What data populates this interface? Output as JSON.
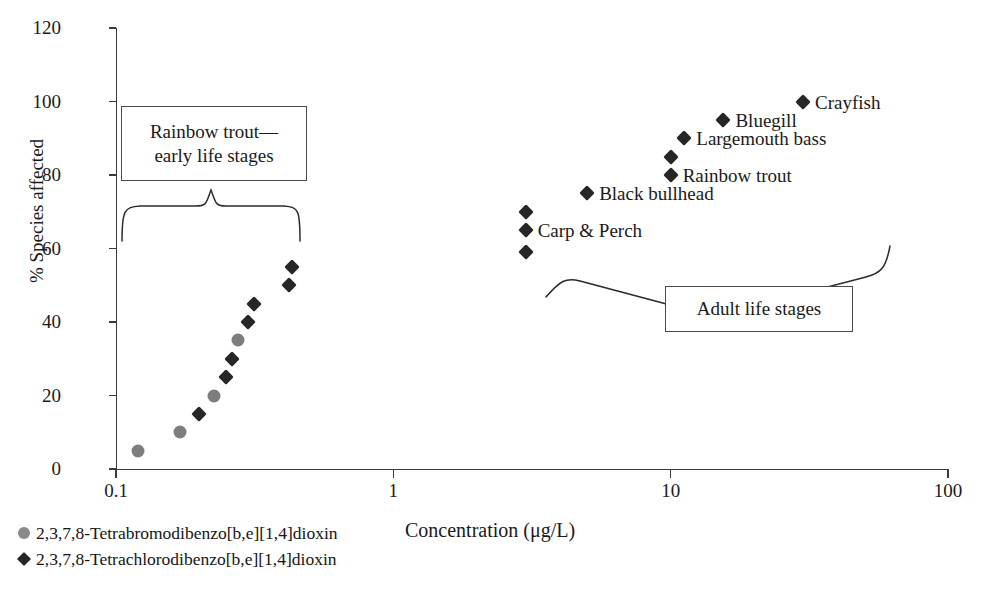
{
  "chart_data": {
    "type": "scatter",
    "title": "",
    "xlabel": "Concentration (μg/L)",
    "ylabel": "% Species affected",
    "xscale": "log",
    "xlim": [
      0.1,
      100
    ],
    "ylim": [
      0,
      120
    ],
    "xticks": [
      "0.1",
      "1",
      "10",
      "100"
    ],
    "xtick_values": [
      0.1,
      1,
      10,
      100
    ],
    "yticks": [
      "0",
      "20",
      "40",
      "60",
      "80",
      "100",
      "120"
    ],
    "ytick_values": [
      0,
      20,
      40,
      60,
      80,
      100,
      120
    ],
    "grid": false,
    "legend_position": "below-left",
    "series": [
      {
        "name": "2,3,7,8-Tetrabromodibenzo[b,e][1,4]dioxin",
        "marker": "circle",
        "color": "#7e7e7e",
        "points": [
          {
            "x": 0.12,
            "y": 5
          },
          {
            "x": 0.17,
            "y": 10
          },
          {
            "x": 0.225,
            "y": 20
          },
          {
            "x": 0.275,
            "y": 35
          }
        ]
      },
      {
        "name": "2,3,7,8-Tetrachlorodibenzo[b,e][1,4]dioxin",
        "marker": "diamond",
        "color": "#262626",
        "points": [
          {
            "x": 0.2,
            "y": 15
          },
          {
            "x": 0.25,
            "y": 25
          },
          {
            "x": 0.262,
            "y": 30
          },
          {
            "x": 0.3,
            "y": 40
          },
          {
            "x": 0.315,
            "y": 45
          },
          {
            "x": 0.42,
            "y": 50
          },
          {
            "x": 0.43,
            "y": 55
          },
          {
            "x": 3.0,
            "y": 59,
            "label": ""
          },
          {
            "x": 3.0,
            "y": 65,
            "label": "Carp & Perch"
          },
          {
            "x": 3.0,
            "y": 70,
            "label": ""
          },
          {
            "x": 5.0,
            "y": 75,
            "label": "Black bullhead"
          },
          {
            "x": 10.0,
            "y": 80,
            "label": "Rainbow trout"
          },
          {
            "x": 10.0,
            "y": 85,
            "label": ""
          },
          {
            "x": 11.2,
            "y": 90,
            "label": "Largemouth bass"
          },
          {
            "x": 15.5,
            "y": 95,
            "label": "Bluegill"
          },
          {
            "x": 30.0,
            "y": 100,
            "label": "Crayfish"
          }
        ]
      }
    ],
    "annotations": [
      {
        "name": "early-life-stages",
        "text_line1": "Rainbow trout—",
        "text_line2": "early life stages",
        "brace": "vertical-down",
        "group_x_range": [
          0.1,
          0.55
        ]
      },
      {
        "name": "adult-life-stages",
        "text_line1": "Adult life stages",
        "brace": "diagonal",
        "group_x_range": [
          2.5,
          60
        ]
      }
    ]
  },
  "axes": {
    "y_title": "% Species affected",
    "x_title": "Concentration (μg/L)",
    "y_ticks": [
      "120",
      "100",
      "80",
      "60",
      "40",
      "20",
      "0"
    ],
    "x_ticks": [
      "0.1",
      "1",
      "10",
      "100"
    ]
  },
  "annotations": {
    "early": {
      "line1": "Rainbow trout—",
      "line2": "early life stages"
    },
    "adult": {
      "line1": "Adult life stages"
    }
  },
  "point_labels": {
    "crayfish": "Crayfish",
    "bluegill": "Bluegill",
    "largemouth_bass": "Largemouth bass",
    "rainbow_trout": "Rainbow trout",
    "black_bullhead": "Black bullhead",
    "carp_perch": "Carp & Perch"
  },
  "legend": {
    "items": [
      {
        "marker": "circle",
        "label": "2,3,7,8-Tetrabromodibenzo[b,e][1,4]dioxin"
      },
      {
        "marker": "diamond",
        "label": "2,3,7,8-Tetrachlorodibenzo[b,e][1,4]dioxin"
      }
    ]
  },
  "colors": {
    "circle_marker": "#7e7e7e",
    "diamond_marker": "#262626",
    "axis": "#3a3a3a",
    "text": "#1a1a1a",
    "background": "#ffffff"
  }
}
